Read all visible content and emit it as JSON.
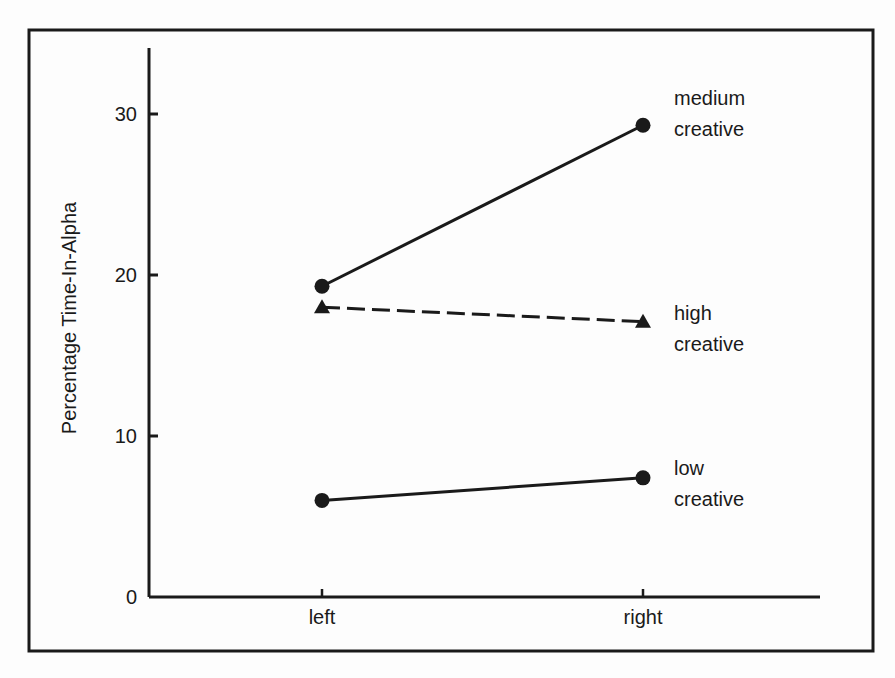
{
  "chart_data": {
    "type": "line",
    "title": "",
    "xlabel": "",
    "ylabel": "Percentage Time-In-Alpha",
    "categories": [
      "left",
      "right"
    ],
    "yticks": [
      0,
      10,
      20,
      30
    ],
    "ylim": [
      0,
      34
    ],
    "grid": false,
    "legend_position": "inline-right",
    "series": [
      {
        "name": "medium creative",
        "label_lines": [
          "medium",
          "creative"
        ],
        "values": [
          19.3,
          29.3
        ],
        "marker": "circle",
        "line_style": "solid"
      },
      {
        "name": "high creative",
        "label_lines": [
          "high",
          "creative"
        ],
        "values": [
          18.0,
          17.1
        ],
        "marker": "triangle",
        "line_style": "dashed"
      },
      {
        "name": "low creative",
        "label_lines": [
          "low",
          "creative"
        ],
        "values": [
          6.0,
          7.4
        ],
        "marker": "circle",
        "line_style": "solid"
      }
    ]
  }
}
